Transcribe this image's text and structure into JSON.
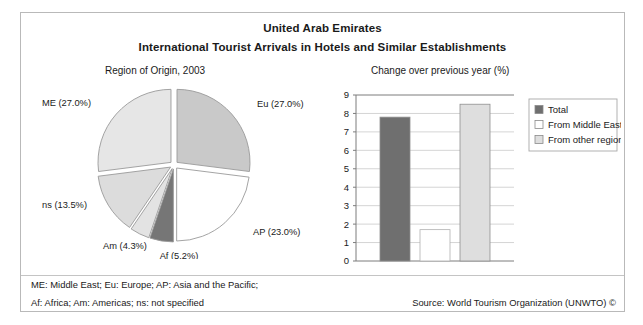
{
  "figure": {
    "title_line1": "United Arab Emirates",
    "title_line2": "International Tourist Arrivals in Hotels and Similar Establishments",
    "left_subtitle": "Region of Origin, 2003",
    "right_subtitle": "Change over previous year (%)",
    "footnote_line1": "ME: Middle East; Eu: Europe; AP: Asia and the Pacific;",
    "footnote_line2": "Af: Africa; Am: Americas; ns: not specified",
    "source": "Source: World Tourism Organization (UNWTO) ©"
  },
  "colors": {
    "frame": "#b9b9b9",
    "gridline": "#c9c9c9",
    "axis": "#7d7d7d",
    "pie_stroke": "#9a9a9a",
    "slice_eu": "#c9c9c9",
    "slice_ap": "#ffffff",
    "slice_af": "#767676",
    "slice_am": "#e3e3e3",
    "slice_ns": "#dcdcdc",
    "slice_me": "#e6e6e6",
    "bar_total": "#6f6f6f",
    "bar_middle_east": "#ffffff",
    "bar_other": "#dedede",
    "text": "#1a1a1a"
  },
  "chart_data": [
    {
      "type": "pie",
      "title": "Region of Origin, 2003",
      "unit": "%",
      "exploded": true,
      "categories": [
        "Eu",
        "AP",
        "Af",
        "Am",
        "ns",
        "ME"
      ],
      "labels": [
        "Eu (27.0%)",
        "AP (23.0%)",
        "Af (5.2%)",
        "Am (4.3%)",
        "ns (13.5%)",
        "ME (27.0%)"
      ],
      "values": [
        27.0,
        23.0,
        5.2,
        4.3,
        13.5,
        27.0
      ],
      "slice_colors": [
        "#c9c9c9",
        "#ffffff",
        "#767676",
        "#e3e3e3",
        "#dcdcdc",
        "#e6e6e6"
      ],
      "category_names": {
        "ME": "Middle East",
        "Eu": "Europe",
        "AP": "Asia and the Pacific",
        "Af": "Africa",
        "Am": "Americas",
        "ns": "not specified"
      }
    },
    {
      "type": "bar",
      "title": "Change over previous year (%)",
      "categories": [
        "2003/2002"
      ],
      "xlabel": "",
      "ylabel": "",
      "ylim": [
        0,
        9
      ],
      "yticks": [
        "0",
        "1",
        "2",
        "3",
        "4",
        "5",
        "6",
        "7",
        "8",
        "9"
      ],
      "grid": true,
      "legend_position": "right",
      "series": [
        {
          "name": "Total",
          "values": [
            7.8
          ],
          "color": "#6f6f6f"
        },
        {
          "name": "From Middle East",
          "values": [
            1.7
          ],
          "color": "#ffffff"
        },
        {
          "name": "From other regions",
          "values": [
            8.5
          ],
          "color": "#dedede"
        }
      ]
    }
  ]
}
